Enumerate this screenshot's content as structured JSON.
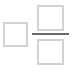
{
  "icon": {
    "name": "fraction-template-icon",
    "description": "box followed by fraction of two boxes",
    "colors": {
      "box_stroke": "#d2d2d2",
      "fraction_bar": "#6a6a6a",
      "background": "#ffffff"
    }
  }
}
